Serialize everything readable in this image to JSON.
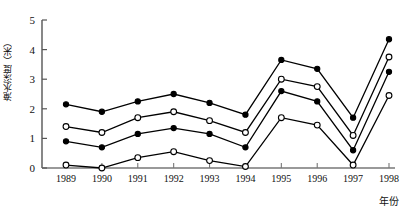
{
  "chart_data": {
    "type": "line",
    "title": "",
    "subtitle": "",
    "xlabel": "年份",
    "ylabel": "淹水深度（米）",
    "categories": [
      "1989",
      "1990",
      "1991",
      "1992",
      "1993",
      "1994",
      "1995",
      "1996",
      "1997",
      "1998"
    ],
    "xlim": [
      1989,
      1998
    ],
    "ylim": [
      0,
      5
    ],
    "yticks": [
      0,
      1,
      2,
      3,
      4,
      5
    ],
    "grid": false,
    "legend": "none",
    "line_color": "#000000",
    "series": [
      {
        "name": "series-1",
        "marker": "filled-circle",
        "values": [
          2.15,
          1.9,
          2.25,
          2.5,
          2.2,
          1.8,
          3.65,
          3.35,
          1.7,
          4.35
        ]
      },
      {
        "name": "series-2",
        "marker": "open-circle",
        "values": [
          1.4,
          1.2,
          1.7,
          1.9,
          1.6,
          1.2,
          3.0,
          2.75,
          1.1,
          3.75
        ]
      },
      {
        "name": "series-3",
        "marker": "filled-circle",
        "values": [
          0.9,
          0.7,
          1.15,
          1.35,
          1.15,
          0.7,
          2.6,
          2.25,
          0.6,
          3.25
        ]
      },
      {
        "name": "series-4",
        "marker": "open-circle",
        "values": [
          0.1,
          0.0,
          0.35,
          0.55,
          0.25,
          0.05,
          1.7,
          1.45,
          0.1,
          2.45
        ]
      }
    ]
  }
}
